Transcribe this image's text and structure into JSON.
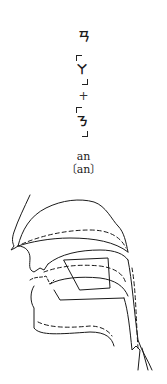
{
  "syllable": {
    "zhuyin": "ㄢ",
    "components": [
      "ㄚ",
      "ㄋ"
    ],
    "operator": "+",
    "pinyin": "an",
    "ipa": "〔an〕"
  },
  "diagram": {
    "line_styles": {
      "solid": "#1a1a1a",
      "dashed": "#1a1a1a"
    }
  }
}
